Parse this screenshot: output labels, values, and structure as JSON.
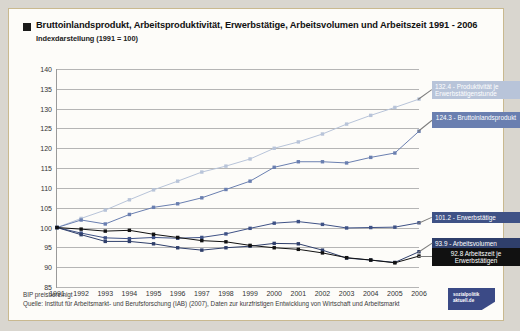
{
  "header": {
    "title": "Bruttoinlandsprodukt, Arbeitsproduktivität, Erwerbstätige, Arbeitsvolumen und Arbeitszeit 1991 - 2006",
    "subtitle": "Indexdarstellung (1991 = 100)"
  },
  "footer": {
    "note": "BIP preisbereinigt",
    "source": "Quelle: Institut für Arbeitsmarkt- und Berufsforschung (IAB) (2007), Daten zur kurzfristigen Entwicklung von Wirtschaft und Arbeitsmarkt"
  },
  "logo": {
    "line1": "sozialpolitik",
    "line2": "aktuell.de"
  },
  "colors": {
    "productivity": "#b8c4d9",
    "gdp": "#6a7fb0",
    "employed": "#3f5286",
    "volume": "#2f3f6b",
    "worktime": "#111111",
    "grid": "#b5b5b5",
    "axis": "#9a9a9a",
    "card_border": "#c9b98f",
    "page_bg": "#d9d6cf"
  },
  "chart_data": {
    "type": "line",
    "title": "Bruttoinlandsprodukt, Arbeitsproduktivität, Erwerbstätige, Arbeitsvolumen und Arbeitszeit 1991 - 2006",
    "subtitle": "Indexdarstellung (1991 = 100)",
    "xlabel": "",
    "ylabel": "",
    "ylim": [
      85,
      140
    ],
    "yticks": [
      85,
      90,
      95,
      100,
      105,
      110,
      115,
      120,
      125,
      130,
      135,
      140
    ],
    "grid": true,
    "legend_position": "right-inline-labels",
    "categories": [
      1991,
      1992,
      1993,
      1994,
      1995,
      1996,
      1997,
      1998,
      1999,
      2000,
      2001,
      2002,
      2003,
      2004,
      2005,
      2006
    ],
    "x": [
      "1991",
      "1992",
      "1993",
      "1994",
      "1995",
      "1996",
      "1997",
      "1998",
      "1999",
      "2000",
      "2001",
      "2002",
      "2003",
      "2004",
      "2005",
      "2006"
    ],
    "series": [
      {
        "name": "Produktivität je Erwerbstätigenstunde",
        "color": "#b8c4d9",
        "end_value": 132.4,
        "end_label": "132.4 - Produktivität je Erwerbstätigenstunde",
        "values": [
          100.0,
          102.3,
          104.4,
          107.0,
          109.5,
          111.7,
          114.0,
          115.5,
          117.3,
          120.0,
          121.6,
          123.6,
          126.1,
          128.3,
          130.3,
          132.4
        ]
      },
      {
        "name": "Bruttoinlandsprodukt",
        "color": "#6a7fb0",
        "end_value": 124.3,
        "end_label": "124.3 - Bruttoinlandsprodukt",
        "values": [
          100.0,
          101.9,
          100.9,
          103.3,
          105.1,
          106.0,
          107.5,
          109.6,
          111.7,
          115.2,
          116.6,
          116.6,
          116.3,
          117.7,
          118.8,
          124.3
        ]
      },
      {
        "name": "Erwerbstätige",
        "color": "#3f5286",
        "end_value": 101.2,
        "end_label": "101.2 - Erwerbstätige",
        "values": [
          100.0,
          98.6,
          97.4,
          97.2,
          97.5,
          97.3,
          97.5,
          98.4,
          99.8,
          101.1,
          101.5,
          100.8,
          99.9,
          100.0,
          100.1,
          101.2
        ]
      },
      {
        "name": "Arbeitsvolumen",
        "color": "#2f3f6b",
        "end_value": 93.9,
        "end_label": "93.9 - Arbeitsvolumen",
        "values": [
          100.0,
          98.2,
          96.5,
          96.5,
          95.9,
          94.9,
          94.3,
          94.9,
          95.3,
          96.0,
          95.9,
          94.3,
          92.3,
          91.8,
          91.2,
          93.9
        ]
      },
      {
        "name": "Arbeitszeit je Erwerbstätigen",
        "color": "#111111",
        "end_value": 92.8,
        "end_label": "92.8 Arbeitszeit je Erwerbstätigen",
        "values": [
          100.0,
          99.6,
          99.1,
          99.3,
          98.3,
          97.5,
          96.7,
          96.4,
          95.5,
          94.9,
          94.5,
          93.6,
          92.4,
          91.8,
          91.1,
          92.8
        ]
      }
    ]
  }
}
